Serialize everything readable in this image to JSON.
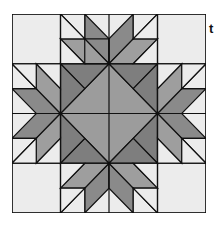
{
  "figure": {
    "side_text": "t",
    "colors": {
      "light": "#ececec",
      "medium": "#9a9a9a",
      "dark": "#7a7a7a",
      "center": "#9c9c9c",
      "line": "#111111"
    }
  }
}
